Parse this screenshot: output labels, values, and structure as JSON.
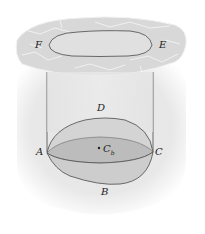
{
  "figure": {
    "labels": {
      "F": "F",
      "E": "E",
      "D": "D",
      "A": "A",
      "C": "C",
      "B": "B",
      "centroid_main": "C",
      "centroid_sub": "b"
    },
    "colors": {
      "background": "#ffffff",
      "surface_top": "#dcdcdc",
      "surface_cracks": "#f4f4f4",
      "column_fill": "#e6e6e6",
      "body_upper": "#d6d6d6",
      "body_band": "#bdbdbd",
      "body_lower": "#cfcfcf",
      "outline": "#4a4a4a"
    }
  }
}
